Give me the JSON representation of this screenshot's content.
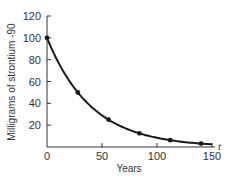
{
  "chart_data": {
    "type": "line",
    "title": "",
    "xlabel": "Years",
    "ylabel": "Milligrams of strontium -90",
    "x_axis_variable": "t",
    "x": [
      0,
      28,
      56,
      84,
      112,
      140
    ],
    "series": [
      {
        "name": "Strontium-90 remaining",
        "values": [
          100,
          50,
          25,
          12.5,
          6.25,
          3.125
        ]
      }
    ],
    "xlim": [
      0,
      150
    ],
    "ylim": [
      0,
      120
    ],
    "xticks": [
      0,
      50,
      100,
      150
    ],
    "yticks": [
      20,
      40,
      60,
      80,
      100,
      120
    ],
    "grid": false,
    "legend": null
  },
  "labels": {
    "xlabel": "Years",
    "ylabel": "Milligrams of strontium -90",
    "t": "t",
    "xticks": [
      "0",
      "50",
      "100",
      "150"
    ],
    "yticks": [
      "20",
      "40",
      "60",
      "80",
      "100",
      "120"
    ]
  },
  "colors": {
    "curve": "#1a1a1a",
    "axis": "#333333"
  }
}
